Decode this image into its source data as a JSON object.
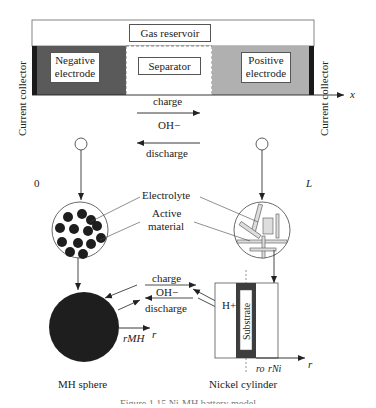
{
  "cell": {
    "gas_reservoir": "Gas reservoir",
    "negative_electrode": "Negative electrode",
    "separator": "Separator",
    "positive_electrode": "Positive electrode",
    "current_collector_left": "Current collector",
    "current_collector_right": "Current collector",
    "charge": "charge",
    "ion": "OH−",
    "discharge": "discharge",
    "axis_x": "x",
    "axis_origin": "0",
    "axis_end": "L"
  },
  "micro": {
    "electrolyte": "Electrolyte",
    "active_material_line1": "Active",
    "active_material_line2": "material"
  },
  "particles": {
    "charge": "charge",
    "ion": "OH−",
    "discharge": "discharge",
    "proton": "H+",
    "substrate": "Substrate",
    "r_mh": "rMH",
    "r": "r",
    "r_o": "ro",
    "r_ni": "rNi",
    "r_axis": "r",
    "mh_sphere": "MH sphere",
    "nickel_cylinder": "Nickel cylinder"
  },
  "caption": "Figure 1.15  Ni-MH battery model",
  "colors": {
    "negative": "#5a5a5a",
    "positive": "#b0b0b0",
    "collector": "#1a1a1a",
    "sphere": "#1e1e1e"
  }
}
